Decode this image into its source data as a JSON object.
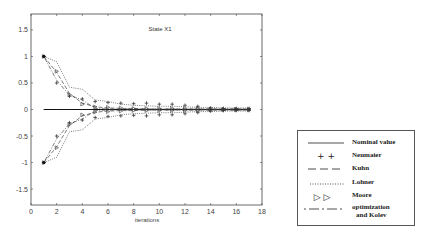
{
  "chart_data": {
    "type": "line",
    "title": "State X1",
    "xlabel": "iterations",
    "ylabel": "",
    "xlim": [
      0,
      18
    ],
    "ylim": [
      -1.8,
      1.8
    ],
    "xticks": [
      0,
      2,
      4,
      6,
      8,
      10,
      12,
      14,
      16,
      18
    ],
    "xtick_labels": [
      "0",
      "2",
      "4",
      "6",
      "8",
      "10",
      "12",
      "14",
      "16",
      "18"
    ],
    "yticks": [
      -1.5,
      -1,
      -0.5,
      0,
      0.5,
      1,
      1.5
    ],
    "ytick_labels": [
      "-1.5",
      "-1",
      "-0.5",
      "0",
      "0.5",
      "1",
      "1.5"
    ],
    "grid": false,
    "legend_position": "outside right, lower",
    "x": [
      1,
      2,
      3,
      4,
      5,
      6,
      7,
      8,
      9,
      10,
      11,
      12,
      13,
      14,
      15,
      16,
      17
    ],
    "series": [
      {
        "name": "Nominal value",
        "style": "solid",
        "upper": [
          0,
          0,
          0,
          0,
          0,
          0,
          0,
          0,
          0,
          0,
          0,
          0,
          0,
          0,
          0,
          0,
          0
        ],
        "lower": [
          0,
          0,
          0,
          0,
          0,
          0,
          0,
          0,
          0,
          0,
          0,
          0,
          0,
          0,
          0,
          0,
          0
        ]
      },
      {
        "name": "Neumaier",
        "style": "plus-markers",
        "upper": [
          1,
          0.5,
          0.25,
          0.2,
          0.15,
          0.13,
          0.12,
          0.11,
          0.12,
          0.1,
          0.1,
          0.08,
          0.06,
          0.03,
          0.02,
          0.02,
          0.02
        ],
        "lower": [
          -1,
          -0.5,
          -0.25,
          -0.2,
          -0.15,
          -0.13,
          -0.12,
          -0.11,
          -0.12,
          -0.1,
          -0.1,
          -0.08,
          -0.06,
          -0.03,
          -0.02,
          -0.02,
          -0.02
        ]
      },
      {
        "name": "Kuhn",
        "style": "dashed",
        "upper": [
          1,
          0.7,
          0.3,
          0.12,
          0.05,
          0.03,
          0.02,
          0.02,
          0.01,
          0.01,
          0.01,
          0.01,
          0.01,
          0.01,
          0.01,
          0.01,
          0.01
        ],
        "lower": [
          -1,
          -0.7,
          -0.3,
          -0.12,
          -0.05,
          -0.03,
          -0.02,
          -0.02,
          -0.01,
          -0.01,
          -0.01,
          -0.01,
          -0.01,
          -0.01,
          -0.01,
          -0.01,
          -0.01
        ]
      },
      {
        "name": "Lohner",
        "style": "dotted",
        "upper": [
          1,
          0.9,
          0.42,
          0.38,
          0.18,
          0.15,
          0.1,
          0.08,
          0.07,
          0.06,
          0.06,
          0.05,
          0.04,
          0.04,
          0.03,
          0.03,
          0.03
        ],
        "lower": [
          -1,
          -0.9,
          -0.42,
          -0.38,
          -0.18,
          -0.15,
          -0.1,
          -0.08,
          -0.07,
          -0.06,
          -0.06,
          -0.05,
          -0.04,
          -0.04,
          -0.03,
          -0.03,
          -0.03
        ]
      },
      {
        "name": "Moore",
        "style": "triangle-markers",
        "upper": [
          1,
          0.72,
          0.28,
          0.1,
          0.05,
          0.04,
          0.03,
          0.02,
          0.02,
          0.02,
          0.02,
          0.02,
          0.02,
          0.01,
          0.01,
          0.01,
          0.01
        ],
        "lower": [
          -1,
          -0.72,
          -0.28,
          -0.1,
          -0.05,
          -0.04,
          -0.03,
          -0.02,
          -0.02,
          -0.02,
          -0.02,
          -0.02,
          -0.02,
          -0.01,
          -0.01,
          -0.01,
          -0.01
        ]
      },
      {
        "name": "optimization and Kolev",
        "style": "dash-dot",
        "upper": [
          1,
          0.55,
          0.27,
          0.18,
          0.02,
          0.01,
          0.01,
          0.01,
          0.01,
          0.01,
          0.01,
          0.01,
          0.01,
          0.01,
          0.01,
          0.01,
          0.01
        ],
        "lower": [
          -1,
          -0.55,
          -0.27,
          -0.18,
          -0.02,
          -0.01,
          -0.01,
          -0.01,
          -0.01,
          -0.01,
          -0.01,
          -0.01,
          -0.01,
          -0.01,
          -0.01,
          -0.01,
          -0.01
        ]
      }
    ]
  },
  "legend": {
    "entries": [
      {
        "label": "Nominal value",
        "sample": "solid"
      },
      {
        "label": "Neumaier",
        "sample": "+ +"
      },
      {
        "label": "Kuhn",
        "sample": "dashed"
      },
      {
        "label": "Lohner",
        "sample": "dotted"
      },
      {
        "label": "Moore",
        "sample": "▷ ▷"
      },
      {
        "label": "optimization",
        "label2": "and Kolev",
        "sample": "dash-dot"
      }
    ]
  },
  "colors": {
    "axis": "#444444",
    "line": "#222222",
    "background": "#ffffff"
  }
}
